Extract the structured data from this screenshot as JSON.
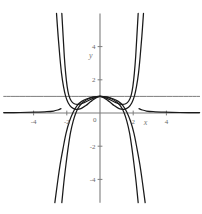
{
  "chart_data": {
    "type": "line",
    "title": "",
    "subtitle": "",
    "xlabel": "x",
    "ylabel": "y",
    "xlim": [
      -5.8,
      6.0
    ],
    "ylim": [
      -5.4,
      6.0
    ],
    "grid": false,
    "legend": "none",
    "axis_color": "#7d7d7d",
    "curve_color": "#1a1a1a",
    "x_ticks": [
      -4,
      -2,
      2,
      4
    ],
    "x_tick_labels": [
      "-4",
      "-2",
      "2",
      "4"
    ],
    "y_ticks": [
      -4,
      -2,
      2,
      4
    ],
    "y_tick_labels": [
      "-4",
      "-2",
      "2",
      "4"
    ],
    "origin_label": "0",
    "annotations": [
      {
        "text": "y",
        "x": -0.55,
        "y": 3.3
      },
      {
        "text": "x",
        "x": 2.75,
        "y": -0.75
      }
    ],
    "series": [
      {
        "name": "horizontal-asymptote-y-equals-1",
        "kind": "line",
        "points": [
          [
            -5.8,
            1
          ],
          [
            6.0,
            1
          ]
        ]
      },
      {
        "name": "curve-a-upward-branches",
        "kind": "curve",
        "note": "even function through (0,1), rises steeply near x = +/-2",
        "points": [
          [
            -2.3,
            6.0
          ],
          [
            -2.22,
            4.6
          ],
          [
            -2.15,
            3.4
          ],
          [
            -2.07,
            2.4
          ],
          [
            -1.98,
            1.6
          ],
          [
            -1.88,
            1.08
          ],
          [
            -1.74,
            0.74
          ],
          [
            -1.55,
            0.56
          ],
          [
            -1.3,
            0.52
          ],
          [
            -1.0,
            0.6
          ],
          [
            -0.7,
            0.75
          ],
          [
            -0.38,
            0.9
          ],
          [
            0.0,
            1.0
          ],
          [
            0.38,
            0.9
          ],
          [
            0.7,
            0.75
          ],
          [
            1.0,
            0.6
          ],
          [
            1.3,
            0.52
          ],
          [
            1.55,
            0.56
          ],
          [
            1.74,
            0.74
          ],
          [
            1.88,
            1.08
          ],
          [
            1.98,
            1.6
          ],
          [
            2.07,
            2.4
          ],
          [
            2.15,
            3.4
          ],
          [
            2.22,
            4.6
          ],
          [
            2.3,
            6.0
          ]
        ]
      },
      {
        "name": "curve-b-upward-branches-narrow",
        "kind": "curve",
        "note": "even function through (0,1), slightly inside curve a",
        "points": [
          [
            -2.62,
            6.0
          ],
          [
            -2.52,
            4.6
          ],
          [
            -2.42,
            3.4
          ],
          [
            -2.32,
            2.4
          ],
          [
            -2.2,
            1.6
          ],
          [
            -2.08,
            1.05
          ],
          [
            -1.92,
            0.62
          ],
          [
            -1.72,
            0.35
          ],
          [
            -1.45,
            0.22
          ],
          [
            -1.15,
            0.26
          ],
          [
            -0.85,
            0.45
          ],
          [
            -0.5,
            0.73
          ],
          [
            0.0,
            1.0
          ],
          [
            0.5,
            0.73
          ],
          [
            0.85,
            0.45
          ],
          [
            1.15,
            0.26
          ],
          [
            1.45,
            0.22
          ],
          [
            1.72,
            0.35
          ],
          [
            1.92,
            0.62
          ],
          [
            2.08,
            1.05
          ],
          [
            2.2,
            1.6
          ],
          [
            2.32,
            2.4
          ],
          [
            2.42,
            3.4
          ],
          [
            2.52,
            4.6
          ],
          [
            2.62,
            6.0
          ]
        ]
      },
      {
        "name": "curve-c-downward-branches",
        "kind": "curve",
        "note": "even function through (0,1), falls steeply to -inf",
        "points": [
          [
            -2.3,
            -5.4
          ],
          [
            -2.18,
            -4.2
          ],
          [
            -2.05,
            -3.1
          ],
          [
            -1.92,
            -2.1
          ],
          [
            -1.78,
            -1.2
          ],
          [
            -1.62,
            -0.5
          ],
          [
            -1.45,
            0.02
          ],
          [
            -1.25,
            0.4
          ],
          [
            -1.0,
            0.66
          ],
          [
            -0.72,
            0.84
          ],
          [
            -0.4,
            0.95
          ],
          [
            0.0,
            1.0
          ],
          [
            0.4,
            0.95
          ],
          [
            0.72,
            0.84
          ],
          [
            1.0,
            0.66
          ],
          [
            1.25,
            0.4
          ],
          [
            1.45,
            0.02
          ],
          [
            1.62,
            -0.5
          ],
          [
            1.78,
            -1.2
          ],
          [
            1.92,
            -2.1
          ],
          [
            2.05,
            -3.1
          ],
          [
            2.18,
            -4.2
          ],
          [
            2.3,
            -5.4
          ]
        ]
      },
      {
        "name": "curve-d-downward-branches-wide",
        "kind": "curve",
        "note": "even function through (0,1), outermost falling branch",
        "points": [
          [
            -2.72,
            -5.4
          ],
          [
            -2.56,
            -4.2
          ],
          [
            -2.4,
            -3.1
          ],
          [
            -2.22,
            -2.1
          ],
          [
            -2.04,
            -1.2
          ],
          [
            -1.84,
            -0.5
          ],
          [
            -1.62,
            0.05
          ],
          [
            -1.38,
            0.45
          ],
          [
            -1.1,
            0.7
          ],
          [
            -0.78,
            0.86
          ],
          [
            -0.42,
            0.96
          ],
          [
            0.0,
            1.0
          ],
          [
            0.42,
            0.96
          ],
          [
            0.78,
            0.86
          ],
          [
            1.1,
            0.7
          ],
          [
            1.38,
            0.45
          ],
          [
            1.62,
            0.05
          ],
          [
            1.84,
            -0.5
          ],
          [
            2.04,
            -1.2
          ],
          [
            2.22,
            -2.1
          ],
          [
            2.4,
            -3.1
          ],
          [
            2.56,
            -4.2
          ],
          [
            2.72,
            -5.4
          ]
        ]
      },
      {
        "name": "flat-tail-left",
        "kind": "curve",
        "note": "near-zero tail approaching y=0 from the left",
        "points": [
          [
            -5.8,
            0.02
          ],
          [
            -4.8,
            0.03
          ],
          [
            -3.9,
            0.05
          ],
          [
            -3.2,
            0.08
          ],
          [
            -2.8,
            0.12
          ],
          [
            -2.55,
            0.18
          ],
          [
            -2.35,
            0.26
          ]
        ]
      },
      {
        "name": "flat-tail-right",
        "kind": "curve",
        "note": "near-zero tail approaching y=0 from the right",
        "points": [
          [
            2.35,
            0.26
          ],
          [
            2.55,
            0.18
          ],
          [
            2.8,
            0.12
          ],
          [
            3.2,
            0.08
          ],
          [
            3.9,
            0.05
          ],
          [
            4.8,
            0.03
          ],
          [
            6.0,
            0.02
          ]
        ]
      }
    ]
  }
}
